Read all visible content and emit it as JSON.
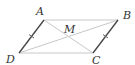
{
  "figure": {
    "type": "parallelogram",
    "points": {
      "A": {
        "label": "A",
        "x": 44,
        "y": 20,
        "label_x": 36,
        "label_y": 6
      },
      "B": {
        "label": "B",
        "x": 118,
        "y": 20,
        "label_x": 123,
        "label_y": 10
      },
      "C": {
        "label": "C",
        "x": 93,
        "y": 53,
        "label_x": 92,
        "label_y": 55
      },
      "D": {
        "label": "D",
        "x": 19,
        "y": 53,
        "label_x": 6,
        "label_y": 54
      },
      "M": {
        "label": "M",
        "x": 68,
        "y": 37,
        "label_x": 64,
        "label_y": 24
      }
    },
    "segments": [
      {
        "name": "AB",
        "from": "A",
        "to": "B",
        "style": "light"
      },
      {
        "name": "DC",
        "from": "D",
        "to": "C",
        "style": "light"
      },
      {
        "name": "AD",
        "from": "A",
        "to": "D",
        "style": "dark",
        "tick": true
      },
      {
        "name": "BC",
        "from": "B",
        "to": "C",
        "style": "dark",
        "tick": true
      },
      {
        "name": "AC",
        "from": "A",
        "to": "C",
        "style": "light"
      },
      {
        "name": "BD",
        "from": "B",
        "to": "D",
        "style": "light"
      }
    ],
    "colors": {
      "light_line": "#c8c8c8",
      "dark_line": "#444444",
      "label": "#333333"
    }
  }
}
